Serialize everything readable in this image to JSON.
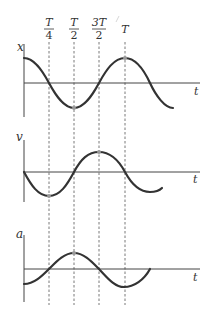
{
  "time_markers": [
    {
      "label_num": "T",
      "label_den": "4",
      "x": 49
    },
    {
      "label_num": "T",
      "label_den": "2",
      "x": 74
    },
    {
      "label_num": "3T",
      "label_den": "2",
      "x": 99
    },
    {
      "label_num": "T",
      "label_den": "",
      "x": 125
    }
  ],
  "graphs": [
    {
      "id": "x",
      "y_label": "x",
      "x_label": "t",
      "axis_top": 44,
      "axis_bottom": 117,
      "baseline": 83,
      "amplitude": 25,
      "function": "cos",
      "end_x": 173
    },
    {
      "id": "v",
      "y_label": "v",
      "x_label": "t",
      "axis_top": 140,
      "axis_bottom": 202,
      "baseline": 172,
      "amplitude": 23,
      "function": "-sin",
      "end_x": 162
    },
    {
      "id": "a",
      "y_label": "a",
      "x_label": "t",
      "axis_top": 235,
      "axis_bottom": 302,
      "baseline": 269,
      "amplitude": 16,
      "function": "-cos",
      "end_x": 150
    }
  ],
  "colors": {
    "curve": "#333333",
    "axis": "#444444",
    "dash": "#555555",
    "marker": "#999999"
  }
}
